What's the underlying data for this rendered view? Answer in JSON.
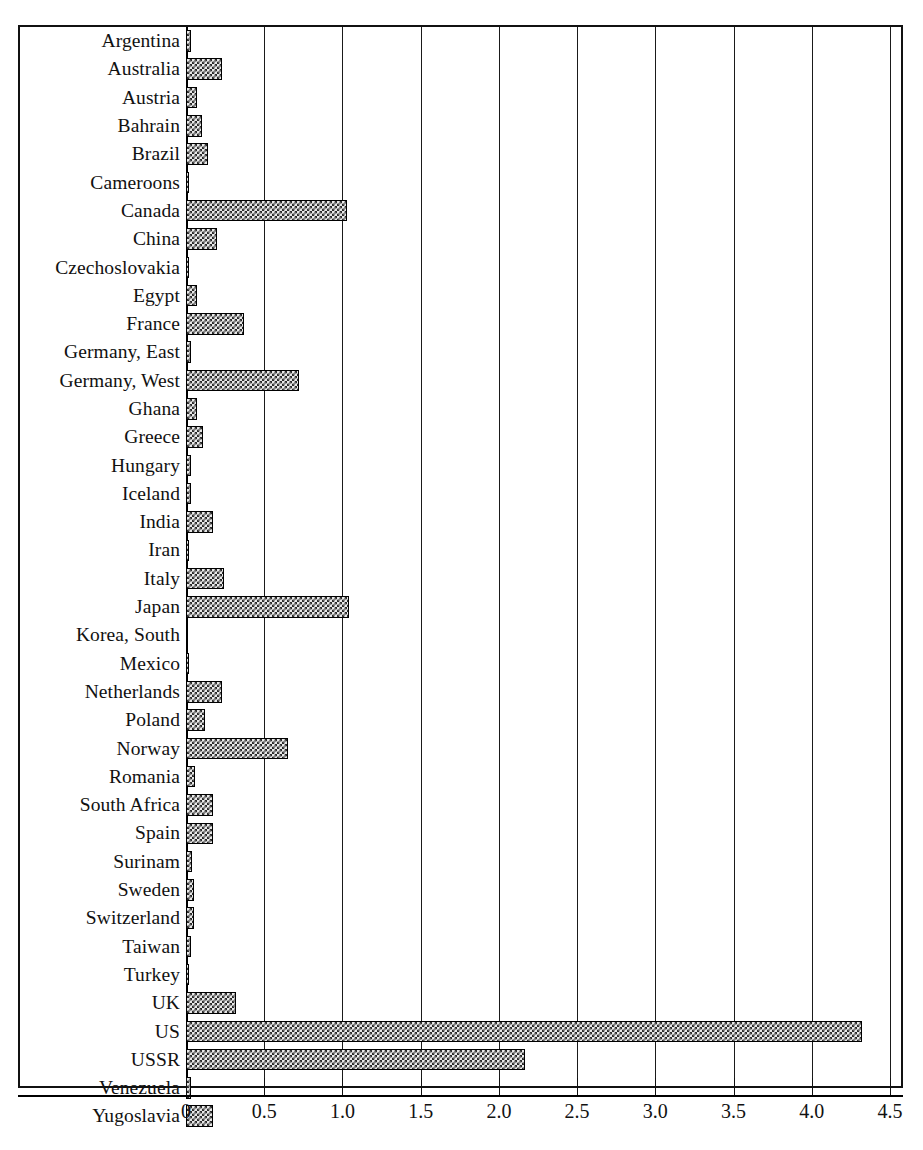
{
  "chart_data": {
    "type": "bar",
    "orientation": "horizontal",
    "title": "",
    "subtitle": "",
    "xlabel": "",
    "ylabel": "",
    "xlim": [
      0,
      4.5
    ],
    "grid": true,
    "legend": null,
    "xticks": [
      "0",
      "0.5",
      "1.0",
      "1.5",
      "2.0",
      "2.5",
      "3.0",
      "3.5",
      "4.0",
      "4.5"
    ],
    "xtick_values": [
      0,
      0.5,
      1.0,
      1.5,
      2.0,
      2.5,
      3.0,
      3.5,
      4.0,
      4.5
    ],
    "categories": [
      "Argentina",
      "Australia",
      "Austria",
      "Bahrain",
      "Brazil",
      "Cameroons",
      "Canada",
      "China",
      "Czechoslovakia",
      "Egypt",
      "France",
      "Germany, East",
      "Germany, West",
      "Ghana",
      "Greece",
      "Hungary",
      "Iceland",
      "India",
      "Iran",
      "Italy",
      "Japan",
      "Korea, South",
      "Mexico",
      "Netherlands",
      "Poland",
      "Norway",
      "Romania",
      "South Africa",
      "Spain",
      "Surinam",
      "Sweden",
      "Switzerland",
      "Taiwan",
      "Turkey",
      "UK",
      "US",
      "USSR",
      "Venezuela",
      "Yugoslavia"
    ],
    "values": [
      0.03,
      0.23,
      0.07,
      0.1,
      0.14,
      0.01,
      1.03,
      0.2,
      0.01,
      0.07,
      0.37,
      0.03,
      0.72,
      0.07,
      0.11,
      0.03,
      0.03,
      0.17,
      0.01,
      0.24,
      1.04,
      0.0,
      0.02,
      0.23,
      0.12,
      0.65,
      0.06,
      0.17,
      0.17,
      0.04,
      0.05,
      0.05,
      0.03,
      0.01,
      0.32,
      4.32,
      2.17,
      0.03,
      0.17
    ]
  },
  "style": {
    "bar_fill": "#e8e8e8",
    "bar_pattern": "#2a2a2a",
    "bar_border": "#000000",
    "frame_color": "#111111",
    "grid_color": "#1a1a1a",
    "background": "#ffffff",
    "text_color": "#111111"
  }
}
